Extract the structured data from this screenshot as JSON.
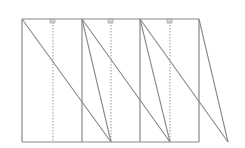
{
  "diagram": {
    "type": "geometric-line-diagram",
    "width": 245,
    "height": 148,
    "colors": {
      "background": "#ffffff",
      "line": "#888888",
      "dotted": "#999999",
      "marker_fill": "#d0d0d0",
      "marker_stroke": "#999999"
    },
    "frame": {
      "x1": 22,
      "x2": 199,
      "y_top": 19,
      "y_bottom": 142
    },
    "solid_verticals": [
      22,
      82,
      140,
      199
    ],
    "dotted_verticals": [
      53,
      111,
      170
    ],
    "markers": [
      {
        "x": 53,
        "y": 19
      },
      {
        "x": 111,
        "y": 19
      },
      {
        "x": 170,
        "y": 19
      }
    ],
    "diagonals": [
      {
        "x1": 22,
        "y1": 19,
        "x2": 111,
        "y2": 142
      },
      {
        "x1": 82,
        "y1": 19,
        "x2": 111,
        "y2": 142
      },
      {
        "x1": 82,
        "y1": 19,
        "x2": 170,
        "y2": 142
      },
      {
        "x1": 140,
        "y1": 19,
        "x2": 170,
        "y2": 142
      },
      {
        "x1": 140,
        "y1": 19,
        "x2": 228,
        "y2": 142
      },
      {
        "x1": 199,
        "y1": 19,
        "x2": 228,
        "y2": 142
      }
    ]
  }
}
